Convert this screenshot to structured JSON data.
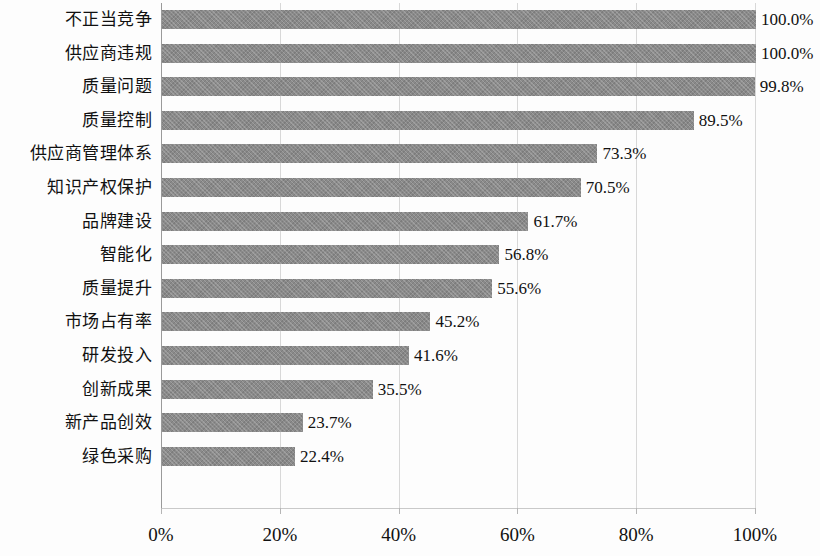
{
  "chart_data": {
    "type": "bar",
    "orientation": "horizontal",
    "title": "",
    "xlabel": "",
    "ylabel": "",
    "xlim": [
      0,
      100
    ],
    "grid": true,
    "legend": false,
    "x_tick_labels": [
      "0%",
      "20%",
      "40%",
      "60%",
      "80%",
      "100%"
    ],
    "x_ticks": [
      0,
      20,
      40,
      60,
      80,
      100
    ],
    "categories": [
      "不正当竞争",
      "供应商违规",
      "质量问题",
      "质量控制",
      "供应商管理体系",
      "知识产权保护",
      "品牌建设",
      "智能化",
      "质量提升",
      "市场占有率",
      "研发投入",
      "创新成果",
      "新产品创效",
      "绿色采购"
    ],
    "values": [
      100.0,
      100.0,
      99.8,
      89.5,
      73.3,
      70.5,
      61.7,
      56.8,
      55.6,
      45.2,
      41.6,
      35.5,
      23.7,
      22.4
    ],
    "value_labels": [
      "100.0%",
      "100.0%",
      "99.8%",
      "89.5%",
      "73.3%",
      "70.5%",
      "61.7%",
      "56.8%",
      "55.6%",
      "45.2%",
      "41.6%",
      "35.5%",
      "23.7%",
      "22.4%"
    ],
    "bar_color": "#8a8a8a",
    "gridline_color": "#d8d8d8",
    "axis_color": "#9a9a9a",
    "text_color": "#111111"
  }
}
